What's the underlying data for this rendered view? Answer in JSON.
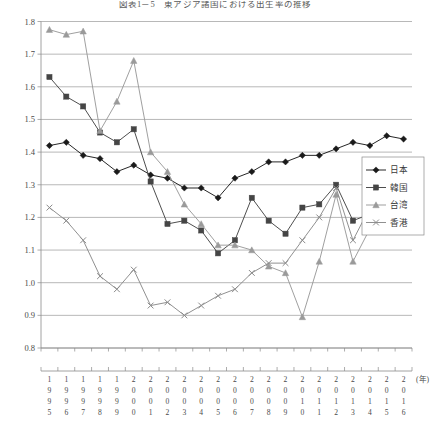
{
  "title": "図表1－5　東アジア諸国における出生率の推移",
  "axis": {
    "y_ticks": [
      "0.8",
      "0.9",
      "1.0",
      "1.1",
      "1.2",
      "1.3",
      "1.4",
      "1.5",
      "1.6",
      "1.7",
      "1.8"
    ],
    "x_unit_label": "(年)"
  },
  "legend": {
    "position": "right",
    "items": [
      {
        "label": "日本",
        "marker": "diamond",
        "color": "#1a1a1a"
      },
      {
        "label": "韓国",
        "marker": "square",
        "color": "#454545"
      },
      {
        "label": "台湾",
        "marker": "triangle",
        "color": "#9a9a9a"
      },
      {
        "label": "香港",
        "marker": "cross",
        "color": "#8a8a8a"
      }
    ]
  },
  "chart_data": {
    "type": "line",
    "title": "図表1－5　東アジア諸国における出生率の推移",
    "xlabel": "(年)",
    "ylabel": "",
    "ylim": [
      0.8,
      1.8
    ],
    "grid": true,
    "legend_position": "right",
    "categories": [
      "1995",
      "1996",
      "1997",
      "1998",
      "1999",
      "2000",
      "2001",
      "2002",
      "2003",
      "2004",
      "2005",
      "2006",
      "2007",
      "2008",
      "2009",
      "2010",
      "2011",
      "2012",
      "2013",
      "2014",
      "2015",
      "2016"
    ],
    "series": [
      {
        "name": "日本",
        "color": "#1a1a1a",
        "marker": "diamond",
        "values": [
          1.42,
          1.43,
          1.39,
          1.38,
          1.34,
          1.36,
          1.33,
          1.32,
          1.29,
          1.29,
          1.26,
          1.32,
          1.34,
          1.37,
          1.37,
          1.39,
          1.39,
          1.41,
          1.43,
          1.42,
          1.45,
          1.44
        ]
      },
      {
        "name": "韓国",
        "color": "#454545",
        "marker": "square",
        "values": [
          1.63,
          1.57,
          1.54,
          1.46,
          1.43,
          1.47,
          1.31,
          1.18,
          1.19,
          1.16,
          1.09,
          1.13,
          1.26,
          1.19,
          1.15,
          1.23,
          1.24,
          1.3,
          1.19,
          1.21,
          1.24,
          1.17
        ]
      },
      {
        "name": "台湾",
        "color": "#9a9a9a",
        "marker": "triangle",
        "values": [
          1.775,
          1.76,
          1.77,
          1.465,
          1.555,
          1.68,
          1.4,
          1.34,
          1.24,
          1.18,
          1.115,
          1.115,
          1.1,
          1.05,
          1.03,
          0.895,
          1.065,
          1.27,
          1.065,
          1.165,
          1.18,
          1.17
        ]
      },
      {
        "name": "香港",
        "color": "#8a8a8a",
        "marker": "cross",
        "values": [
          1.23,
          1.19,
          1.13,
          1.02,
          0.98,
          1.04,
          0.93,
          0.94,
          0.9,
          0.93,
          0.96,
          0.98,
          1.03,
          1.06,
          1.06,
          1.13,
          1.2,
          1.29,
          1.13,
          1.23,
          1.2,
          1.21
        ]
      }
    ]
  }
}
